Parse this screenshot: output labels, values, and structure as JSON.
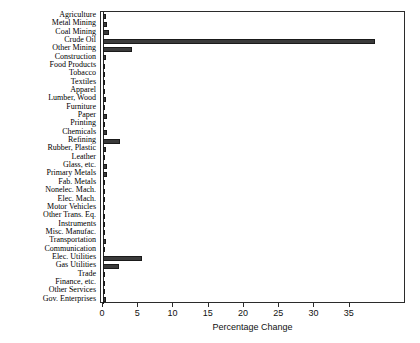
{
  "chart_data": {
    "type": "bar",
    "orientation": "horizontal",
    "title": "",
    "xlabel": "Percentage Change",
    "ylabel": "",
    "xlim": [
      0,
      41
    ],
    "xticks": [
      0,
      5,
      10,
      15,
      20,
      25,
      30,
      35
    ],
    "xticklabels": [
      "0",
      "5",
      "10",
      "15",
      "20",
      "25",
      "30",
      "35"
    ],
    "grid": false,
    "legend": null,
    "bar_color": "#3a3a3a",
    "frame_color": "#2b2b2b",
    "categories": [
      "Agriculture",
      "Metal Mining",
      "Coal Mining",
      "Crude Oil",
      "Other Mining",
      "Construction",
      "Food Products",
      "Tobacco",
      "Textiles",
      "Apparel",
      "Lumber, Wood",
      "Furniture",
      "Paper",
      "Printing",
      "Chemicals",
      "Refining",
      "Rubber, Plastic",
      "Leather",
      "Glass, etc.",
      "Primary Metals",
      "Fab. Metals",
      "Nonelec. Mach.",
      "Elec. Mach.",
      "Motor Vehicles",
      "Other Trans. Eq.",
      "Instruments",
      "Misc. Manufac.",
      "Transportation",
      "Communication",
      "Elec. Utilities",
      "Gas Utilities",
      "Trade",
      "Finance, etc.",
      "Other Services",
      "Gov. Enterprises"
    ],
    "values": [
      0.4,
      0.5,
      0.8,
      38.6,
      4.1,
      0.4,
      0.3,
      0.2,
      0.3,
      0.3,
      0.4,
      0.3,
      0.5,
      0.2,
      0.6,
      2.4,
      0.4,
      0.2,
      0.5,
      0.6,
      0.3,
      0.3,
      0.3,
      0.3,
      0.2,
      0.2,
      0.2,
      0.4,
      0.3,
      5.6,
      2.3,
      0.3,
      0.3,
      0.3,
      0.4
    ]
  }
}
